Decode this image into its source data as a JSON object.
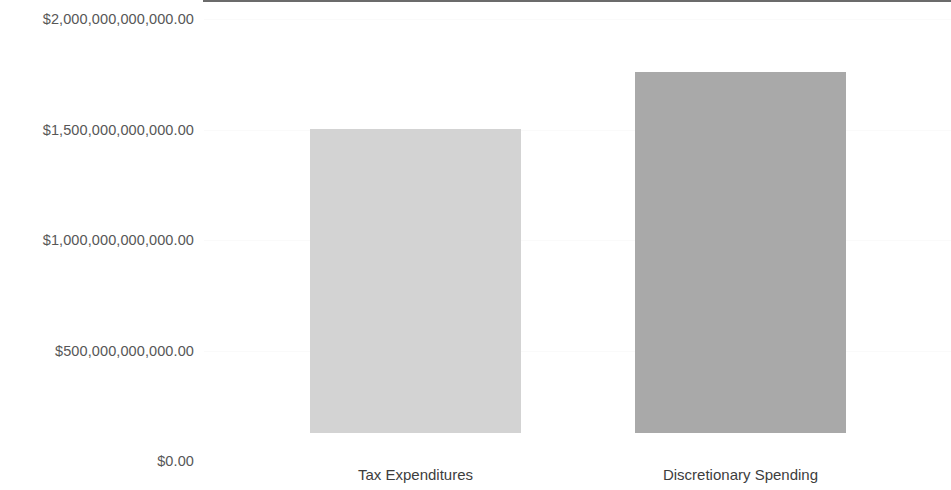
{
  "chart_data": {
    "type": "bar",
    "title": "",
    "subtitle": "",
    "xlabel": "",
    "ylabel": "",
    "categories": [
      "Tax Expenditures",
      "Discretionary Spending"
    ],
    "values": [
      1375000000000,
      1633000000000
    ],
    "value_labels": [
      "$1,375,000,000,000.00",
      "$1,633,000,000,000.00"
    ],
    "bar_colors": [
      "#d3d3d3",
      "#a9a9a9"
    ],
    "ylim": [
      0,
      2000000000000
    ],
    "ytick_values": [
      0,
      500000000000,
      1000000000000,
      1500000000000,
      2000000000000
    ],
    "ytick_labels": [
      "$0.00",
      "$500,000,000,000.00",
      "$1,000,000,000,000.00",
      "$1,500,000,000,000.00",
      "$2,000,000,000,000.00"
    ],
    "grid": true,
    "gridline_color": "#fafafa",
    "axis_color": "#6b6b6b",
    "legend": null,
    "legend_position": "none",
    "annotations": []
  },
  "axis": {
    "tick_label_color": "#575757",
    "category_label_color": "#3d3d3d"
  }
}
